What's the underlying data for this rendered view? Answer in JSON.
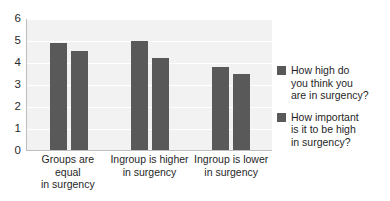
{
  "chart_data": {
    "type": "bar",
    "title": "",
    "xlabel": "",
    "ylabel": "",
    "ylim": [
      0,
      6
    ],
    "y_ticks": [
      "6",
      "5",
      "4",
      "3",
      "2",
      "1",
      "0"
    ],
    "grid": true,
    "legend_position": "right",
    "categories": [
      "Groups are equal in surgency",
      "Ingroup is higher in surgency",
      "Ingroup is lower in surgency"
    ],
    "series": [
      {
        "name": "How high do you think you are in surgency?",
        "color": "#595959",
        "values": [
          4.9,
          5.0,
          3.8
        ]
      },
      {
        "name": "How important is it to be high in surgency?",
        "color": "#595959",
        "values": [
          4.55,
          4.2,
          3.5
        ]
      }
    ]
  },
  "axis": {
    "ticks": [
      {
        "label": "6",
        "value": 6
      },
      {
        "label": "5",
        "value": 5
      },
      {
        "label": "4",
        "value": 4
      },
      {
        "label": "3",
        "value": 3
      },
      {
        "label": "2",
        "value": 2
      },
      {
        "label": "1",
        "value": 1
      },
      {
        "label": "0",
        "value": 0
      }
    ]
  },
  "x_categories": [
    {
      "line1": "Groups are equal",
      "line2": "in surgency"
    },
    {
      "line1": "Ingroup is higher",
      "line2": "in surgency"
    },
    {
      "line1": "Ingroup is lower",
      "line2": "in surgency"
    }
  ],
  "legend": {
    "items": [
      {
        "line1": "How high do",
        "line2": "you think you",
        "line3": "are in surgency?",
        "swatch_name": "legend-swatch-series-1"
      },
      {
        "line1": "How important",
        "line2": "is it to be high",
        "line3": "in surgency?",
        "swatch_name": "legend-swatch-series-2"
      }
    ]
  },
  "colors": {
    "bar": "#595959",
    "plot_background": "#f2f2f2",
    "gridline": "#ffffff",
    "axis": "#bdbdbd"
  }
}
